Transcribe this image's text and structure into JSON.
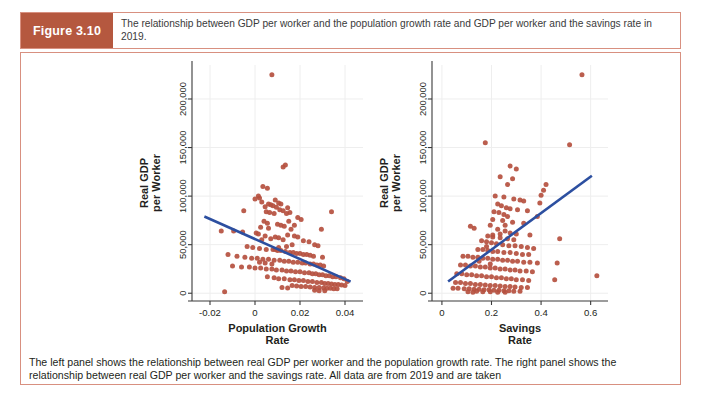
{
  "figure": {
    "badge_label": "Figure 3.10",
    "caption_top": "The relationship between GDP per worker and the population growth rate and GDP per worker and the savings rate in 2019.",
    "caption_bottom": "The left panel shows the relationship between real GDP per worker and the population growth rate. The right panel shows the relationship between real GDP per worker and the savings rate. All data are from 2019 and are taken"
  },
  "colors": {
    "badge_bg": "#b5583f",
    "frame_border": "#d89080",
    "point": "#b5503f",
    "trend_line": "#2c4fa0",
    "gridline": "#eeeeee",
    "axis": "#3a3a3a",
    "text": "#231f20"
  },
  "chart_data": [
    {
      "type": "scatter",
      "id": "population-growth-panel",
      "title": "",
      "xlabel": "Population Growth\nRate",
      "xlabel_line1": "Population Growth",
      "xlabel_line2": "Rate",
      "ylabel": "Real GDP\nper Worker",
      "ylabel_line1": "Real GDP",
      "ylabel_line2": "per Worker",
      "xlim": [
        -0.028,
        0.048
      ],
      "ylim": [
        -8000,
        235000
      ],
      "xticks": [
        -0.02,
        0,
        0.02,
        0.04
      ],
      "xticklabels": [
        "-0.02",
        "0",
        "0.02",
        "0.04"
      ],
      "yticks": [
        0,
        50000,
        100000,
        150000,
        200000
      ],
      "yticklabels": [
        "0",
        "50,000",
        "100,000",
        "150,000",
        "200,000"
      ],
      "grid": true,
      "legend": "none",
      "trend": {
        "x0": -0.0225,
        "y0": 79000,
        "x1": 0.0425,
        "y1": 12000
      },
      "points": [
        [
          0.0075,
          225000
        ],
        [
          0.0125,
          130000
        ],
        [
          0.0135,
          132000
        ],
        [
          0.0035,
          110000
        ],
        [
          0.0055,
          108000
        ],
        [
          0.002,
          98000
        ],
        [
          0.003,
          94000
        ],
        [
          0.0145,
          88000
        ],
        [
          0.0155,
          83000
        ],
        [
          0.0015,
          100000
        ],
        [
          0.0,
          97000
        ],
        [
          0.009,
          96000
        ],
        [
          0.0105,
          93000
        ],
        [
          0.0115,
          92000
        ],
        [
          0.006,
          92000
        ],
        [
          0.007,
          91000
        ],
        [
          0.008,
          90000
        ],
        [
          0.0045,
          89000
        ],
        [
          0.0095,
          88500
        ],
        [
          0.011,
          86000
        ],
        [
          0.0125,
          85000
        ],
        [
          -0.005,
          85000
        ],
        [
          0.014,
          82000
        ],
        [
          0.005,
          84000
        ],
        [
          0.0065,
          83000
        ],
        [
          0.0085,
          82000
        ],
        [
          0.034,
          84000
        ],
        [
          0.019,
          78000
        ],
        [
          0.0205,
          76000
        ],
        [
          0.015,
          74000
        ],
        [
          0.004,
          74000
        ],
        [
          0.0055,
          72000
        ],
        [
          0.01,
          71000
        ],
        [
          0.0115,
          70000
        ],
        [
          0.0175,
          70000
        ],
        [
          0.013,
          69000
        ],
        [
          0.0025,
          68000
        ],
        [
          0.006,
          67000
        ],
        [
          0.016,
          66000
        ],
        [
          0.0295,
          66000
        ],
        [
          -0.015,
          64000
        ],
        [
          -0.0095,
          64000
        ],
        [
          -0.0055,
          63000
        ],
        [
          0.0005,
          62000
        ],
        [
          0.0015,
          61000
        ],
        [
          0.0145,
          60000
        ],
        [
          0.0175,
          59000
        ],
        [
          0.019,
          58000
        ],
        [
          0.0045,
          59000
        ],
        [
          0.009,
          58000
        ],
        [
          0.0105,
          57000
        ],
        [
          0.007,
          56000
        ],
        [
          0.003,
          55000
        ],
        [
          0.0125,
          55000
        ],
        [
          0.0215,
          54000
        ],
        [
          0.024,
          53000
        ],
        [
          0.0265,
          50000
        ],
        [
          0.028,
          49000
        ],
        [
          -0.0035,
          48000
        ],
        [
          -0.001,
          47000
        ],
        [
          0.002,
          46000
        ],
        [
          0.005,
          45000
        ],
        [
          0.008,
          45000
        ],
        [
          0.01,
          44000
        ],
        [
          0.0115,
          44000
        ],
        [
          0.0135,
          43000
        ],
        [
          0.0155,
          42000
        ],
        [
          0.017,
          42000
        ],
        [
          0.0185,
          41000
        ],
        [
          0.02,
          41000
        ],
        [
          0.0215,
          40000
        ],
        [
          0.023,
          40000
        ],
        [
          0.0245,
          39000
        ],
        [
          -0.012,
          40000
        ],
        [
          -0.008,
          38000
        ],
        [
          -0.0045,
          37000
        ],
        [
          -0.0015,
          36000
        ],
        [
          0.001,
          36000
        ],
        [
          0.0035,
          35000
        ],
        [
          0.006,
          35000
        ],
        [
          0.0085,
          34000
        ],
        [
          0.011,
          34000
        ],
        [
          0.013,
          33000
        ],
        [
          0.015,
          33000
        ],
        [
          0.017,
          32000
        ],
        [
          0.019,
          32000
        ],
        [
          0.021,
          31000
        ],
        [
          0.0225,
          31000
        ],
        [
          0.0245,
          30000
        ],
        [
          0.026,
          30000
        ],
        [
          0.0275,
          29000
        ],
        [
          0.029,
          29000
        ],
        [
          0.0305,
          28000
        ],
        [
          -0.01,
          28000
        ],
        [
          -0.006,
          27000
        ],
        [
          -0.0025,
          27000
        ],
        [
          0.0,
          26000
        ],
        [
          0.0025,
          26000
        ],
        [
          0.005,
          25000
        ],
        [
          0.0075,
          25000
        ],
        [
          0.0095,
          24000
        ],
        [
          0.012,
          24000
        ],
        [
          0.014,
          23000
        ],
        [
          0.016,
          23000
        ],
        [
          0.018,
          22000
        ],
        [
          0.02,
          22000
        ],
        [
          0.022,
          21000
        ],
        [
          0.024,
          21000
        ],
        [
          0.0255,
          20000
        ],
        [
          0.027,
          20000
        ],
        [
          0.0285,
          19000
        ],
        [
          0.03,
          19000
        ],
        [
          0.0315,
          18000
        ],
        [
          0.033,
          18000
        ],
        [
          0.0345,
          17000
        ],
        [
          0.036,
          17000
        ],
        [
          0.038,
          16000
        ],
        [
          0.0395,
          15000
        ],
        [
          0.0055,
          17000
        ],
        [
          0.0085,
          16000
        ],
        [
          0.0105,
          15000
        ],
        [
          0.013,
          15000
        ],
        [
          0.0155,
          14000
        ],
        [
          0.0175,
          14000
        ],
        [
          0.0195,
          13000
        ],
        [
          0.0215,
          13000
        ],
        [
          0.0235,
          12000
        ],
        [
          0.0255,
          12000
        ],
        [
          0.0275,
          11000
        ],
        [
          0.0295,
          11000
        ],
        [
          0.031,
          10000
        ],
        [
          0.0325,
          10000
        ],
        [
          0.034,
          9500
        ],
        [
          0.0355,
          9000
        ],
        [
          0.037,
          9000
        ],
        [
          0.0385,
          8500
        ],
        [
          0.04,
          8000
        ],
        [
          0.041,
          12000
        ],
        [
          0.0165,
          8000
        ],
        [
          0.0185,
          7500
        ],
        [
          0.0205,
          7000
        ],
        [
          0.0225,
          7000
        ],
        [
          0.0245,
          6500
        ],
        [
          0.0265,
          6000
        ],
        [
          0.0285,
          6000
        ],
        [
          0.0305,
          5500
        ],
        [
          0.032,
          5000
        ],
        [
          0.0335,
          5000
        ],
        [
          0.035,
          4500
        ],
        [
          0.0365,
          4500
        ],
        [
          0.012,
          6000
        ],
        [
          0.0145,
          5500
        ],
        [
          0.0265,
          3000
        ],
        [
          0.0285,
          2500
        ],
        [
          0.031,
          2500
        ],
        [
          -0.0135,
          1500
        ],
        [
          0.009,
          45000
        ],
        [
          0.0105,
          47000
        ],
        [
          0.014,
          48000
        ],
        [
          0.0165,
          50000
        ],
        [
          0.026,
          38000
        ],
        [
          0.03,
          37000
        ],
        [
          0.0075,
          30000
        ],
        [
          0.0045,
          31000
        ],
        [
          0.002,
          32000
        ]
      ]
    },
    {
      "type": "scatter",
      "id": "savings-rate-panel",
      "title": "",
      "xlabel": "Savings\nRate",
      "xlabel_line1": "Savings",
      "xlabel_line2": "Rate",
      "ylabel": "Real GDP\nper Worker",
      "ylabel_line1": "Real GDP",
      "ylabel_line2": "per Worker",
      "xlim": [
        -0.04,
        0.67
      ],
      "ylim": [
        -8000,
        235000
      ],
      "xticks": [
        0,
        0.2,
        0.4,
        0.6
      ],
      "xticklabels": [
        "0",
        "0.2",
        "0.4",
        "0.6"
      ],
      "yticks": [
        0,
        50000,
        100000,
        150000,
        200000
      ],
      "yticklabels": [
        "0",
        "50,000",
        "100,000",
        "150,000",
        "200,000"
      ],
      "grid": true,
      "legend": "none",
      "trend": {
        "x0": 0.025,
        "y0": 12000,
        "x1": 0.605,
        "y1": 121000
      },
      "points": [
        [
          0.565,
          225000
        ],
        [
          0.175,
          155000
        ],
        [
          0.515,
          153000
        ],
        [
          0.275,
          131000
        ],
        [
          0.3,
          128000
        ],
        [
          0.235,
          120000
        ],
        [
          0.285,
          118000
        ],
        [
          0.265,
          112000
        ],
        [
          0.42,
          112000
        ],
        [
          0.41,
          106000
        ],
        [
          0.4,
          101000
        ],
        [
          0.215,
          100000
        ],
        [
          0.25,
          99000
        ],
        [
          0.29,
          97000
        ],
        [
          0.315,
          96000
        ],
        [
          0.33,
          95000
        ],
        [
          0.395,
          93000
        ],
        [
          0.225,
          92000
        ],
        [
          0.24,
          90000
        ],
        [
          0.26,
          88000
        ],
        [
          0.275,
          87000
        ],
        [
          0.305,
          86000
        ],
        [
          0.345,
          85000
        ],
        [
          0.21,
          84000
        ],
        [
          0.23,
          83000
        ],
        [
          0.25,
          81000
        ],
        [
          0.265,
          79000
        ],
        [
          0.385,
          79000
        ],
        [
          0.205,
          76000
        ],
        [
          0.245,
          75000
        ],
        [
          0.285,
          73000
        ],
        [
          0.33,
          72000
        ],
        [
          0.195,
          70000
        ],
        [
          0.115,
          69000
        ],
        [
          0.13,
          67000
        ],
        [
          0.225,
          66000
        ],
        [
          0.255,
          64000
        ],
        [
          0.275,
          62000
        ],
        [
          0.3,
          61000
        ],
        [
          0.355,
          60000
        ],
        [
          0.185,
          59000
        ],
        [
          0.205,
          58000
        ],
        [
          0.235,
          57000
        ],
        [
          0.265,
          56000
        ],
        [
          0.29,
          55000
        ],
        [
          0.475,
          56000
        ],
        [
          0.16,
          54000
        ],
        [
          0.18,
          53000
        ],
        [
          0.2,
          52000
        ],
        [
          0.22,
          51000
        ],
        [
          0.245,
          50000
        ],
        [
          0.27,
          49000
        ],
        [
          0.295,
          49000
        ],
        [
          0.32,
          48000
        ],
        [
          0.345,
          47000
        ],
        [
          0.37,
          46000
        ],
        [
          0.145,
          45000
        ],
        [
          0.165,
          45000
        ],
        [
          0.185,
          44000
        ],
        [
          0.205,
          43000
        ],
        [
          0.225,
          43000
        ],
        [
          0.25,
          42000
        ],
        [
          0.275,
          42000
        ],
        [
          0.3,
          41000
        ],
        [
          0.325,
          40000
        ],
        [
          0.35,
          40000
        ],
        [
          0.085,
          38000
        ],
        [
          0.105,
          38000
        ],
        [
          0.125,
          37000
        ],
        [
          0.145,
          37000
        ],
        [
          0.165,
          36000
        ],
        [
          0.185,
          36000
        ],
        [
          0.205,
          35000
        ],
        [
          0.225,
          35000
        ],
        [
          0.245,
          34000
        ],
        [
          0.265,
          34000
        ],
        [
          0.285,
          33000
        ],
        [
          0.305,
          33000
        ],
        [
          0.33,
          32000
        ],
        [
          0.355,
          32000
        ],
        [
          0.385,
          31000
        ],
        [
          0.465,
          31000
        ],
        [
          0.075,
          29000
        ],
        [
          0.095,
          29000
        ],
        [
          0.115,
          28000
        ],
        [
          0.135,
          28000
        ],
        [
          0.155,
          27000
        ],
        [
          0.175,
          27000
        ],
        [
          0.195,
          26000
        ],
        [
          0.215,
          26000
        ],
        [
          0.235,
          25000
        ],
        [
          0.255,
          25000
        ],
        [
          0.275,
          24000
        ],
        [
          0.295,
          24000
        ],
        [
          0.315,
          23000
        ],
        [
          0.34,
          23000
        ],
        [
          0.365,
          22000
        ],
        [
          0.06,
          20000
        ],
        [
          0.08,
          20000
        ],
        [
          0.1,
          19000
        ],
        [
          0.12,
          19000
        ],
        [
          0.14,
          18000
        ],
        [
          0.16,
          18000
        ],
        [
          0.18,
          17000
        ],
        [
          0.2,
          17000
        ],
        [
          0.22,
          16000
        ],
        [
          0.24,
          16000
        ],
        [
          0.26,
          15000
        ],
        [
          0.28,
          15000
        ],
        [
          0.3,
          14000
        ],
        [
          0.325,
          14000
        ],
        [
          0.35,
          13000
        ],
        [
          0.455,
          14000
        ],
        [
          0.055,
          11000
        ],
        [
          0.075,
          11000
        ],
        [
          0.095,
          10000
        ],
        [
          0.115,
          10000
        ],
        [
          0.135,
          9000
        ],
        [
          0.155,
          9000
        ],
        [
          0.175,
          8500
        ],
        [
          0.195,
          8000
        ],
        [
          0.215,
          8000
        ],
        [
          0.235,
          7500
        ],
        [
          0.255,
          7000
        ],
        [
          0.275,
          7000
        ],
        [
          0.295,
          6500
        ],
        [
          0.32,
          6000
        ],
        [
          0.345,
          6000
        ],
        [
          0.045,
          5000
        ],
        [
          0.065,
          5000
        ],
        [
          0.09,
          4500
        ],
        [
          0.11,
          4500
        ],
        [
          0.13,
          4000
        ],
        [
          0.15,
          4000
        ],
        [
          0.17,
          3500
        ],
        [
          0.19,
          3500
        ],
        [
          0.21,
          3000
        ],
        [
          0.23,
          3000
        ],
        [
          0.25,
          2500
        ],
        [
          0.27,
          2500
        ],
        [
          0.29,
          2000
        ],
        [
          0.315,
          2000
        ],
        [
          0.625,
          18000
        ],
        [
          0.14,
          2000
        ],
        [
          0.165,
          1500
        ],
        [
          0.105,
          1500
        ],
        [
          0.195,
          1500
        ],
        [
          0.225,
          1000
        ],
        [
          0.255,
          1000
        ],
        [
          0.125,
          1000
        ],
        [
          0.205,
          60000
        ],
        [
          0.235,
          61000
        ],
        [
          0.255,
          70000
        ],
        [
          0.18,
          48000
        ],
        [
          0.15,
          33000
        ],
        [
          0.195,
          30000
        ]
      ]
    }
  ]
}
